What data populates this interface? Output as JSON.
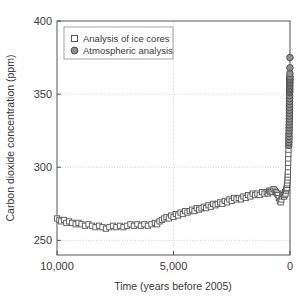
{
  "chart_data": {
    "type": "scatter",
    "title": "",
    "xlabel": "Time (years before 2005)",
    "ylabel": "Carbon dioxide concentration (ppm)",
    "xlim": [
      10000,
      0
    ],
    "ylim": [
      240,
      400
    ],
    "x_reversed": true,
    "grid": true,
    "xticks": [
      10000,
      5000,
      0
    ],
    "xtick_labels": [
      "10,000",
      "5,000",
      "0"
    ],
    "yticks": [
      250,
      300,
      350,
      400
    ],
    "ytick_labels": [
      "250",
      "300",
      "350",
      "400"
    ],
    "legend_position": "upper left",
    "series": [
      {
        "name": "Analysis of ice cores",
        "marker": "square-open",
        "marker_color": "#ffffff",
        "marker_edge_color": "#555555",
        "points": [
          [
            10000,
            265
          ],
          [
            9900,
            264
          ],
          [
            9820,
            263
          ],
          [
            9700,
            264
          ],
          [
            9600,
            262
          ],
          [
            9480,
            263
          ],
          [
            9350,
            262
          ],
          [
            9200,
            261
          ],
          [
            9080,
            262
          ],
          [
            8950,
            261
          ],
          [
            8800,
            260
          ],
          [
            8650,
            261
          ],
          [
            8500,
            260
          ],
          [
            8350,
            259
          ],
          [
            8200,
            260
          ],
          [
            8050,
            259
          ],
          [
            7900,
            258
          ],
          [
            7750,
            259
          ],
          [
            7600,
            260
          ],
          [
            7450,
            259
          ],
          [
            7300,
            260
          ],
          [
            7150,
            259
          ],
          [
            7000,
            260
          ],
          [
            6850,
            261
          ],
          [
            6700,
            260
          ],
          [
            6550,
            261
          ],
          [
            6400,
            260
          ],
          [
            6250,
            261
          ],
          [
            6100,
            260
          ],
          [
            5950,
            261
          ],
          [
            5800,
            262
          ],
          [
            5700,
            261
          ],
          [
            5600,
            263
          ],
          [
            5500,
            264
          ],
          [
            5400,
            265
          ],
          [
            5300,
            266
          ],
          [
            5200,
            265
          ],
          [
            5100,
            267
          ],
          [
            5000,
            266
          ],
          [
            4900,
            268
          ],
          [
            4800,
            267
          ],
          [
            4700,
            269
          ],
          [
            4600,
            268
          ],
          [
            4500,
            270
          ],
          [
            4400,
            269
          ],
          [
            4300,
            270
          ],
          [
            4200,
            271
          ],
          [
            4100,
            270
          ],
          [
            4000,
            272
          ],
          [
            3900,
            271
          ],
          [
            3800,
            272
          ],
          [
            3700,
            273
          ],
          [
            3600,
            272
          ],
          [
            3500,
            274
          ],
          [
            3400,
            273
          ],
          [
            3300,
            275
          ],
          [
            3200,
            274
          ],
          [
            3100,
            275
          ],
          [
            3000,
            276
          ],
          [
            2900,
            275
          ],
          [
            2800,
            277
          ],
          [
            2700,
            276
          ],
          [
            2600,
            278
          ],
          [
            2500,
            277
          ],
          [
            2400,
            279
          ],
          [
            2300,
            278
          ],
          [
            2200,
            279
          ],
          [
            2100,
            278
          ],
          [
            2000,
            280
          ],
          [
            1900,
            279
          ],
          [
            1800,
            281
          ],
          [
            1700,
            280
          ],
          [
            1600,
            282
          ],
          [
            1500,
            281
          ],
          [
            1400,
            282
          ],
          [
            1300,
            281
          ],
          [
            1200,
            283
          ],
          [
            1100,
            282
          ],
          [
            1000,
            283
          ],
          [
            950,
            282
          ],
          [
            900,
            284
          ],
          [
            850,
            283
          ],
          [
            800,
            284
          ],
          [
            750,
            283
          ],
          [
            700,
            285
          ],
          [
            650,
            284
          ],
          [
            600,
            283
          ],
          [
            560,
            282
          ],
          [
            520,
            281
          ],
          [
            480,
            279
          ],
          [
            440,
            277
          ],
          [
            400,
            276
          ],
          [
            370,
            278
          ],
          [
            340,
            280
          ],
          [
            310,
            282
          ],
          [
            280,
            281
          ],
          [
            250,
            280
          ],
          [
            230,
            281
          ],
          [
            210,
            283
          ],
          [
            190,
            282
          ],
          [
            170,
            284
          ],
          [
            150,
            285
          ],
          [
            140,
            286
          ],
          [
            130,
            288
          ],
          [
            120,
            289
          ],
          [
            110,
            291
          ],
          [
            100,
            293
          ],
          [
            95,
            295
          ],
          [
            90,
            297
          ],
          [
            85,
            300
          ],
          [
            80,
            303
          ],
          [
            75,
            306
          ],
          [
            70,
            309
          ],
          [
            65,
            312
          ],
          [
            60,
            315
          ],
          [
            55,
            318
          ],
          [
            50,
            321
          ],
          [
            45,
            324
          ],
          [
            42,
            327
          ],
          [
            40,
            329
          ],
          [
            38,
            331
          ],
          [
            36,
            333
          ],
          [
            34,
            335
          ],
          [
            32,
            337
          ],
          [
            30,
            339
          ],
          [
            28,
            341
          ],
          [
            26,
            343
          ],
          [
            24,
            345
          ],
          [
            22,
            347
          ],
          [
            20,
            349
          ],
          [
            18,
            351
          ],
          [
            16,
            353
          ],
          [
            14,
            355
          ],
          [
            12,
            357
          ]
        ]
      },
      {
        "name": "Atmospheric analysis",
        "marker": "circle-filled",
        "marker_color": "#8f8f8f",
        "marker_edge_color": "#4a4a4a",
        "points": [
          [
            48,
            315
          ],
          [
            46,
            317
          ],
          [
            44,
            319
          ],
          [
            42,
            321
          ],
          [
            40,
            323
          ],
          [
            38,
            325
          ],
          [
            36,
            327
          ],
          [
            34,
            329
          ],
          [
            32,
            331
          ],
          [
            30,
            333
          ],
          [
            28,
            335
          ],
          [
            26,
            337
          ],
          [
            24,
            339
          ],
          [
            22,
            341
          ],
          [
            20,
            343
          ],
          [
            19,
            345
          ],
          [
            18,
            347
          ],
          [
            17,
            349
          ],
          [
            16,
            351
          ],
          [
            15,
            352
          ],
          [
            14,
            353
          ],
          [
            13,
            354
          ],
          [
            12,
            355
          ],
          [
            11,
            356
          ],
          [
            10,
            357
          ],
          [
            9,
            358
          ],
          [
            8,
            359
          ],
          [
            7,
            360
          ],
          [
            6,
            361
          ],
          [
            5,
            362
          ],
          [
            4,
            364
          ],
          [
            3,
            368
          ],
          [
            2,
            375
          ]
        ]
      }
    ]
  },
  "legend": {
    "entries": [
      {
        "label": "Analysis of ice cores",
        "marker": "square-open-marker"
      },
      {
        "label": "Atmospheric analysis",
        "marker": "circle-filled-marker"
      }
    ]
  },
  "colors": {
    "axis": "#3a3a3a",
    "grid": "#c8c8c8",
    "ice_core_marker_fill": "#ffffff",
    "ice_core_marker_edge": "#555555",
    "atmospheric_marker_fill": "#8f8f8f",
    "atmospheric_marker_edge": "#4a4a4a",
    "background": "#ffffff"
  }
}
